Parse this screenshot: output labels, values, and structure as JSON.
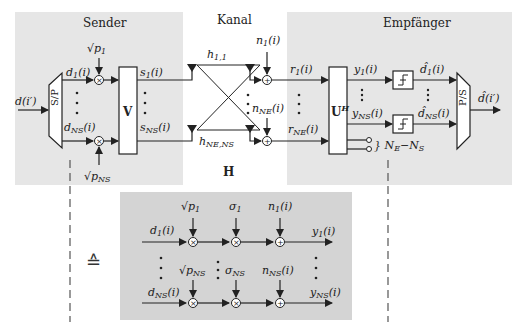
{
  "sections": {
    "sender": {
      "title": "Sender",
      "bg": "#e6e6e6"
    },
    "channel": {
      "title": "Kanal",
      "matrix_label": "H"
    },
    "receiver": {
      "title": "Empfänger",
      "bg": "#e6e6e6"
    }
  },
  "sender": {
    "input": "d(i')",
    "sp_block": "S/P",
    "precoder": "V",
    "streams": [
      {
        "data": "d₁(i)",
        "power": "√p₁",
        "output": "s₁(i)"
      },
      {
        "data": "d_NS(i)",
        "power": "√p_NS",
        "output": "s_NS(i)"
      }
    ]
  },
  "channel": {
    "coefficients": [
      "h₁,₁",
      "h_NE,NS"
    ],
    "noise": [
      "n₁(i)",
      "n_NE(i)"
    ]
  },
  "receiver": {
    "received": [
      "r₁(i)",
      "r_NE(i)"
    ],
    "filter": "Uᴴ",
    "outputs": [
      "y₁(i)",
      "y_NS(i)"
    ],
    "decisions": [
      "d̂₁(i)",
      "d̂_NS(i)"
    ],
    "unused_label": "} N_E−N_S",
    "ps_block": "P/S",
    "output": "d̂(i')"
  },
  "equivalent": {
    "symbol": "≙",
    "bg": "#d4d4d4",
    "rows": [
      {
        "input": "d₁(i)",
        "power": "√p₁",
        "gain": "σ₁",
        "noise": "n₁(i)",
        "output": "y₁(i)"
      },
      {
        "input": "d_NS(i)",
        "power": "√p_NS",
        "gain": "σ_NS",
        "noise": "n_NS(i)",
        "output": "y_NS(i)"
      }
    ]
  },
  "colors": {
    "line": "#222222",
    "panel": "#e6e6e6",
    "equiv_panel": "#d4d4d4"
  }
}
